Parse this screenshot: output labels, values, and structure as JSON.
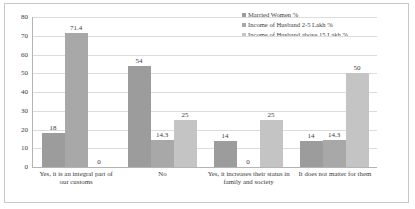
{
  "chart_data": {
    "type": "bar",
    "title": "",
    "xlabel": "",
    "ylabel": "",
    "ylim": [
      0,
      80
    ],
    "ytick_step": 10,
    "yticks": [
      "80",
      "70",
      "60",
      "50",
      "40",
      "30",
      "20",
      "10",
      "0"
    ],
    "grid": true,
    "legend_position": "top-right",
    "categories": [
      "Yes, it is an integral part of our customs",
      "No",
      "Yes, it increases their status in family and society",
      "It does not matter for them"
    ],
    "series": [
      {
        "name": "Married Women %",
        "color": "#9c9c9c",
        "values": [
          18,
          54,
          14,
          14
        ],
        "labels": [
          "18",
          "54",
          "14",
          "14"
        ]
      },
      {
        "name": "Income of Husband 2-5 Lakh %",
        "color": "#a8a8a8",
        "values": [
          71.4,
          14.3,
          0,
          14.3
        ],
        "labels": [
          "71.4",
          "14.3",
          "0",
          "14.3"
        ]
      },
      {
        "name": "Income of Husband above 15 Lakh %",
        "color": "#c4c4c4",
        "values": [
          0,
          25,
          25,
          50
        ],
        "labels": [
          "0",
          "25",
          "25",
          "50"
        ]
      }
    ]
  },
  "colors": {
    "series_1": "#9c9c9c",
    "series_2": "#a8a8a8",
    "series_3": "#c4c4c4",
    "gridline": "#dcdcdc",
    "axis": "#b4b4b4",
    "border": "#c8c8c8",
    "text": "#3b3b3b",
    "background": "#ffffff"
  }
}
